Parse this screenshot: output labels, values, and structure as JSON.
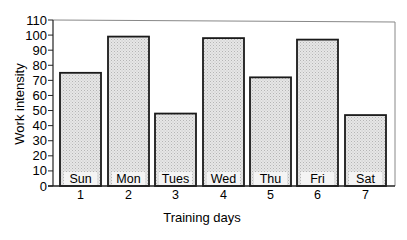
{
  "chart_data": {
    "type": "bar",
    "title": "",
    "xlabel": "Training days",
    "ylabel": "Work intensity",
    "categories": [
      "1",
      "2",
      "3",
      "4",
      "5",
      "6",
      "7"
    ],
    "bar_labels": [
      "Sun",
      "Mon",
      "Tues",
      "Wed",
      "Thu",
      "Fri",
      "Sat"
    ],
    "values": [
      75,
      99,
      48,
      98,
      72,
      97,
      47
    ],
    "ylim": [
      0,
      110
    ],
    "yticks": [
      0,
      10,
      20,
      30,
      40,
      50,
      60,
      70,
      80,
      90,
      100,
      110
    ],
    "grid": false,
    "legend": null
  },
  "colors": {
    "bar_fill": "#d9d9d9",
    "bar_stroke": "#1a1a1a",
    "axis": "#222222",
    "frame": "#888888"
  }
}
